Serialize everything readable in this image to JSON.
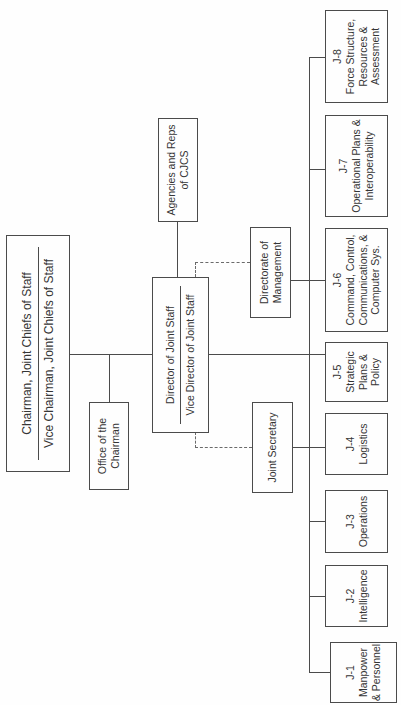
{
  "page": {
    "background": "#fefefe",
    "line_color": "#4b4b4b",
    "dashed_line_color": "#6a6a6a",
    "text_color": "#353535",
    "orientation": "chart rotated 90 degrees counterclockwise, text reads bottom-to-top"
  },
  "nodes": {
    "chairman": {
      "line1": "Chairman, Joint Chiefs of Staff",
      "line2": "Vice Chairman, Joint Chiefs of Staff"
    },
    "office_of_chairman": {
      "line1": "Office of the",
      "line2": "Chairman"
    },
    "director": {
      "line1": "Director of Joint Staff",
      "line2": "Vice Director of Joint Staff"
    },
    "agencies": {
      "line1": "Agencies and Reps",
      "line2": "of CJCS"
    },
    "directorate_of_management": {
      "line1": "Directorate of",
      "line2": "Management"
    },
    "joint_secretary": {
      "line1": "Joint Secretary"
    },
    "j1": {
      "line1": "J-1",
      "line2": "Manpower",
      "line3": "& Personnel"
    },
    "j2": {
      "line1": "J-2",
      "line2": "Intelligence"
    },
    "j3": {
      "line1": "J-3",
      "line2": "Operations"
    },
    "j4": {
      "line1": "J-4",
      "line2": "Logistics"
    },
    "j5": {
      "line1": "J-5",
      "line2": "Strategic",
      "line3": "Plans &",
      "line4": "Policy"
    },
    "j6": {
      "line1": "J-6",
      "line2": "Command, Control,",
      "line3": "Communications, &",
      "line4": "Computer Sys."
    },
    "j7": {
      "line1": "J-7",
      "line2": "Operational Plans &",
      "line3": "Interoperability"
    },
    "j8": {
      "line1": "J-8",
      "line2": "Force Structure,",
      "line3": "Resources &",
      "line4": "Assessment"
    }
  },
  "edges": [
    {
      "from": "chairman",
      "to": "office_of_chairman",
      "style": "solid"
    },
    {
      "from": "chairman",
      "to": "director",
      "style": "solid"
    },
    {
      "from": "director",
      "to": "agencies",
      "style": "solid"
    },
    {
      "from": "director",
      "to": "joint_secretary",
      "style": "dashed"
    },
    {
      "from": "director",
      "to": "directorate_of_management",
      "style": "dashed"
    },
    {
      "from": "director",
      "to": "j_row_rail",
      "style": "solid"
    },
    {
      "from": "joint_secretary",
      "to": "j4",
      "style": "solid"
    },
    {
      "from": "directorate_of_management",
      "to": "j6",
      "style": "solid"
    },
    {
      "from": "j_row_rail",
      "to": "j1",
      "style": "solid"
    },
    {
      "from": "j_row_rail",
      "to": "j2",
      "style": "solid"
    },
    {
      "from": "j_row_rail",
      "to": "j3",
      "style": "solid"
    },
    {
      "from": "j_row_rail",
      "to": "j4",
      "style": "solid"
    },
    {
      "from": "j_row_rail",
      "to": "j5",
      "style": "solid"
    },
    {
      "from": "j_row_rail",
      "to": "j6",
      "style": "solid"
    },
    {
      "from": "j_row_rail",
      "to": "j7",
      "style": "solid"
    },
    {
      "from": "j_row_rail",
      "to": "j8",
      "style": "solid"
    }
  ]
}
